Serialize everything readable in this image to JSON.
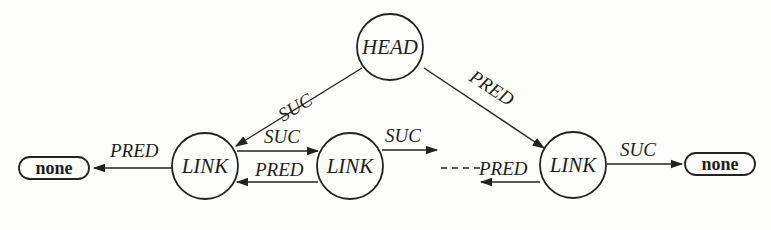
{
  "diagram": {
    "type": "doubly-linked list with head node",
    "nodes": {
      "head": {
        "label": "HEAD"
      },
      "link1": {
        "label": "LINK"
      },
      "link2": {
        "label": "LINK"
      },
      "link_last": {
        "label": "LINK"
      },
      "none_left": {
        "label": "none"
      },
      "none_right": {
        "label": "none"
      }
    },
    "edges": {
      "head_to_link1": {
        "label": "SUC"
      },
      "head_to_last": {
        "label": "PRED"
      },
      "link1_to_none": {
        "label": "PRED"
      },
      "link1_to_link2": {
        "label": "SUC"
      },
      "link2_to_link1": {
        "label": "PRED"
      },
      "link2_to_next": {
        "label": "SUC"
      },
      "last_to_prev": {
        "label": "PRED"
      },
      "last_to_none": {
        "label": "SUC"
      }
    },
    "colors": {
      "ink": "#222222",
      "background": "#fdfdfb"
    }
  }
}
